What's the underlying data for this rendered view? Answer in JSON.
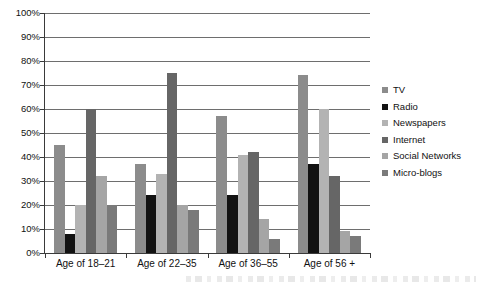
{
  "chart_data": {
    "type": "bar",
    "title": "",
    "xlabel": "",
    "ylabel": "",
    "ylim": [
      0,
      100
    ],
    "ytick_labels": [
      "100%",
      "90%",
      "80%",
      "70%",
      "60%",
      "50%",
      "40%",
      "30%",
      "20%",
      "10%",
      "0%"
    ],
    "ytick_values": [
      100,
      90,
      80,
      70,
      60,
      50,
      40,
      30,
      20,
      10,
      0
    ],
    "grid": true,
    "legend_position": "right",
    "categories": [
      "Age of 18–21",
      "Age of 22–35",
      "Age of 36–55",
      "Age of 56 +"
    ],
    "series": [
      {
        "name": "TV",
        "color": "#8c8c8c",
        "values": [
          45,
          37,
          57,
          74
        ]
      },
      {
        "name": "Radio",
        "color": "#121212",
        "values": [
          8,
          24,
          24,
          37
        ]
      },
      {
        "name": "Newspapers",
        "color": "#b3b3b3",
        "values": [
          20,
          33,
          41,
          60
        ]
      },
      {
        "name": "Internet",
        "color": "#666666",
        "values": [
          60,
          75,
          42,
          32
        ]
      },
      {
        "name": "Social Networks",
        "color": "#a5a5a5",
        "values": [
          32,
          20,
          14,
          9
        ]
      },
      {
        "name": "Micro-blogs",
        "color": "#7a7a7a",
        "values": [
          20,
          18,
          6,
          7
        ]
      }
    ]
  },
  "axis": {
    "y_labels": [
      "100%",
      "90%",
      "80%",
      "70%",
      "60%",
      "50%",
      "40%",
      "30%",
      "20%",
      "10%",
      "0%"
    ],
    "x_labels": [
      "Age of 18–21",
      "Age of 22–35",
      "Age of 36–55",
      "Age of 56 +"
    ]
  },
  "legend": {
    "items": [
      {
        "label": "TV"
      },
      {
        "label": "Radio"
      },
      {
        "label": "Newspapers"
      },
      {
        "label": "Internet"
      },
      {
        "label": "Social Networks"
      },
      {
        "label": "Micro-blogs"
      }
    ]
  }
}
